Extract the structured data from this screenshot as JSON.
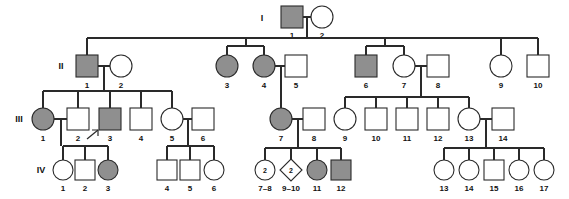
{
  "figure": {
    "type": "pedigree",
    "width": 569,
    "height": 199,
    "background_color": "#ffffff",
    "line_color": "#2a2a2a",
    "affected_fill_color": "#8f8f8f",
    "unaffected_fill_color": "#ffffff"
  },
  "legend_semantics": {
    "square": "male",
    "circle": "female",
    "diamond": "unspecified sex",
    "filled": "affected",
    "open": "unaffected",
    "arrow": "proband",
    "number_inside_symbol": "number of siblings represented"
  },
  "generation_labels": [
    {
      "id": "gen-I",
      "text": "I",
      "x": 262,
      "y": 18
    },
    {
      "id": "gen-II",
      "text": "II",
      "x": 61,
      "y": 66
    },
    {
      "id": "gen-III",
      "text": "III",
      "x": 19,
      "y": 119
    },
    {
      "id": "gen-IV",
      "text": "IV",
      "x": 41,
      "y": 170
    }
  ],
  "individuals": [
    {
      "key": "I-1",
      "gen": "I",
      "label": "1",
      "shape": "square",
      "affected": true,
      "cx": 292,
      "cy": 17
    },
    {
      "key": "I-2",
      "gen": "I",
      "label": "2",
      "shape": "circle",
      "affected": false,
      "cx": 322,
      "cy": 17
    },
    {
      "key": "II-1",
      "gen": "II",
      "label": "1",
      "shape": "square",
      "affected": true,
      "cx": 87,
      "cy": 66
    },
    {
      "key": "II-2",
      "gen": "II",
      "label": "2",
      "shape": "circle",
      "affected": false,
      "cx": 121,
      "cy": 66
    },
    {
      "key": "II-3",
      "gen": "II",
      "label": "3",
      "shape": "circle",
      "affected": true,
      "cx": 227,
      "cy": 66
    },
    {
      "key": "II-4",
      "gen": "II",
      "label": "4",
      "shape": "circle",
      "affected": true,
      "cx": 264,
      "cy": 66
    },
    {
      "key": "II-5",
      "gen": "II",
      "label": "5",
      "shape": "square",
      "affected": false,
      "cx": 296,
      "cy": 66
    },
    {
      "key": "II-6",
      "gen": "II",
      "label": "6",
      "shape": "square",
      "affected": true,
      "cx": 366,
      "cy": 66
    },
    {
      "key": "II-7",
      "gen": "II",
      "label": "7",
      "shape": "circle",
      "affected": false,
      "cx": 404,
      "cy": 66
    },
    {
      "key": "II-8",
      "gen": "II",
      "label": "8",
      "shape": "square",
      "affected": false,
      "cx": 438,
      "cy": 66
    },
    {
      "key": "II-9",
      "gen": "II",
      "label": "9",
      "shape": "circle",
      "affected": false,
      "cx": 501,
      "cy": 66
    },
    {
      "key": "II-10",
      "gen": "II",
      "label": "10",
      "shape": "square",
      "affected": false,
      "cx": 538,
      "cy": 66
    },
    {
      "key": "III-1",
      "gen": "III",
      "label": "1",
      "shape": "circle",
      "affected": true,
      "cx": 43,
      "cy": 119
    },
    {
      "key": "III-2",
      "gen": "III",
      "label": "2",
      "shape": "square",
      "affected": false,
      "cx": 78,
      "cy": 119
    },
    {
      "key": "III-3",
      "gen": "III",
      "label": "3",
      "shape": "square",
      "affected": true,
      "cx": 110,
      "cy": 119,
      "proband": true
    },
    {
      "key": "III-4",
      "gen": "III",
      "label": "4",
      "shape": "square",
      "affected": false,
      "cx": 141,
      "cy": 119
    },
    {
      "key": "III-5",
      "gen": "III",
      "label": "5",
      "shape": "circle",
      "affected": false,
      "cx": 172,
      "cy": 119
    },
    {
      "key": "III-6",
      "gen": "III",
      "label": "6",
      "shape": "square",
      "affected": false,
      "cx": 203,
      "cy": 119
    },
    {
      "key": "III-7",
      "gen": "III",
      "label": "7",
      "shape": "circle",
      "affected": true,
      "cx": 281,
      "cy": 119
    },
    {
      "key": "III-8",
      "gen": "III",
      "label": "8",
      "shape": "square",
      "affected": false,
      "cx": 314,
      "cy": 119
    },
    {
      "key": "III-9",
      "gen": "III",
      "label": "9",
      "shape": "circle",
      "affected": false,
      "cx": 345,
      "cy": 119
    },
    {
      "key": "III-10",
      "gen": "III",
      "label": "10",
      "shape": "square",
      "affected": false,
      "cx": 376,
      "cy": 119
    },
    {
      "key": "III-11",
      "gen": "III",
      "label": "11",
      "shape": "square",
      "affected": false,
      "cx": 407,
      "cy": 119
    },
    {
      "key": "III-12",
      "gen": "III",
      "label": "12",
      "shape": "square",
      "affected": false,
      "cx": 438,
      "cy": 119
    },
    {
      "key": "III-13",
      "gen": "III",
      "label": "13",
      "shape": "circle",
      "affected": false,
      "cx": 469,
      "cy": 119
    },
    {
      "key": "III-14",
      "gen": "III",
      "label": "14",
      "shape": "square",
      "affected": false,
      "cx": 503,
      "cy": 119
    },
    {
      "key": "IV-1",
      "gen": "IV",
      "label": "1",
      "shape": "circle",
      "affected": false,
      "cx": 63,
      "cy": 170
    },
    {
      "key": "IV-2",
      "gen": "IV",
      "label": "2",
      "shape": "square",
      "affected": false,
      "cx": 85,
      "cy": 170
    },
    {
      "key": "IV-3",
      "gen": "IV",
      "label": "3",
      "shape": "circle",
      "affected": true,
      "cx": 108,
      "cy": 170
    },
    {
      "key": "IV-4",
      "gen": "IV",
      "label": "4",
      "shape": "square",
      "affected": false,
      "cx": 167,
      "cy": 170
    },
    {
      "key": "IV-5",
      "gen": "IV",
      "label": "5",
      "shape": "square",
      "affected": false,
      "cx": 190,
      "cy": 170
    },
    {
      "key": "IV-6",
      "gen": "IV",
      "label": "6",
      "shape": "circle",
      "affected": false,
      "cx": 214,
      "cy": 170
    },
    {
      "key": "IV-7-8",
      "gen": "IV",
      "label": "7–8",
      "shape": "circle",
      "affected": false,
      "cx": 265,
      "cy": 170,
      "count": "2"
    },
    {
      "key": "IV-9-10",
      "gen": "IV",
      "label": "9–10",
      "shape": "diamond",
      "affected": false,
      "cx": 291,
      "cy": 170,
      "count": "2"
    },
    {
      "key": "IV-11",
      "gen": "IV",
      "label": "11",
      "shape": "circle",
      "affected": true,
      "cx": 317,
      "cy": 170
    },
    {
      "key": "IV-12",
      "gen": "IV",
      "label": "12",
      "shape": "square",
      "affected": true,
      "cx": 341,
      "cy": 170
    },
    {
      "key": "IV-13",
      "gen": "IV",
      "label": "13",
      "shape": "circle",
      "affected": false,
      "cx": 444,
      "cy": 170
    },
    {
      "key": "IV-14",
      "gen": "IV",
      "label": "14",
      "shape": "circle",
      "affected": false,
      "cx": 469,
      "cy": 170
    },
    {
      "key": "IV-15",
      "gen": "IV",
      "label": "15",
      "shape": "square",
      "affected": false,
      "cx": 494,
      "cy": 170
    },
    {
      "key": "IV-16",
      "gen": "IV",
      "label": "16",
      "shape": "circle",
      "affected": false,
      "cx": 519,
      "cy": 170
    },
    {
      "key": "IV-17",
      "gen": "IV",
      "label": "17",
      "shape": "circle",
      "affected": false,
      "cx": 544,
      "cy": 170
    }
  ],
  "matings": [
    {
      "key": "I-1xI-2",
      "partners": [
        "I-1",
        "I-2"
      ],
      "children": [
        "II-1",
        "II-3",
        "II-4",
        "II-6",
        "II-9"
      ]
    },
    {
      "key": "II-1xII-2",
      "partners": [
        "II-1",
        "II-2"
      ],
      "children": [
        "III-1",
        "III-2",
        "III-3",
        "III-4",
        "III-5"
      ]
    },
    {
      "key": "II-4xII-5",
      "partners": [
        "II-4",
        "II-5"
      ],
      "children": [
        "III-7"
      ]
    },
    {
      "key": "II-7xII-8",
      "partners": [
        "II-7",
        "II-8"
      ],
      "children": [
        "III-9",
        "III-10",
        "III-11",
        "III-12",
        "III-13"
      ]
    },
    {
      "key": "II-9xII-10",
      "partners": [
        "II-9",
        "II-10"
      ],
      "children": []
    },
    {
      "key": "III-1xIII-2",
      "partners": [
        "III-1",
        "III-2"
      ],
      "children": [
        "IV-1",
        "IV-2",
        "IV-3"
      ]
    },
    {
      "key": "III-5xIII-6",
      "partners": [
        "III-5",
        "III-6"
      ],
      "children": [
        "IV-4",
        "IV-5",
        "IV-6"
      ]
    },
    {
      "key": "III-7xIII-8",
      "partners": [
        "III-7",
        "III-8"
      ],
      "children": [
        "IV-7-8",
        "IV-9-10",
        "IV-11",
        "IV-12"
      ]
    },
    {
      "key": "III-13xIII-14",
      "partners": [
        "III-13",
        "III-14"
      ],
      "children": [
        "IV-13",
        "IV-14",
        "IV-15",
        "IV-16",
        "IV-17"
      ]
    }
  ],
  "counts": {
    "generation_I": 2,
    "generation_II": 10,
    "generation_III": 14,
    "generation_IV": 17
  }
}
